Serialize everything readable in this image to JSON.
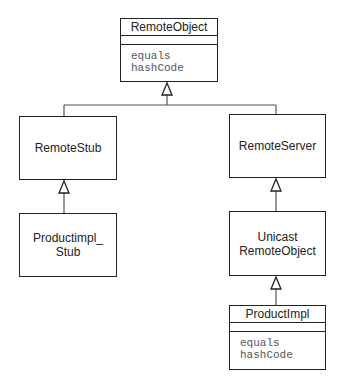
{
  "diagram": {
    "type": "uml-class-inheritance",
    "classes": {
      "remote_object": {
        "name": "RemoteObject",
        "methods": [
          "equals",
          "hashCode"
        ]
      },
      "remote_stub": {
        "name": "RemoteStub"
      },
      "remote_server": {
        "name": "RemoteServer"
      },
      "product_impl_stub": {
        "name_lines": [
          "Productimpl_",
          "Stub"
        ]
      },
      "unicast_remote_object": {
        "name_lines": [
          "Unicast",
          "RemoteObject"
        ]
      },
      "product_impl": {
        "name": "ProductImpl",
        "methods": [
          "equals",
          "hashCode"
        ]
      }
    },
    "relationships": [
      {
        "from": "RemoteStub",
        "to": "RemoteObject",
        "kind": "generalization"
      },
      {
        "from": "RemoteServer",
        "to": "RemoteObject",
        "kind": "generalization"
      },
      {
        "from": "Productimpl_Stub",
        "to": "RemoteStub",
        "kind": "generalization"
      },
      {
        "from": "UnicastRemoteObject",
        "to": "RemoteServer",
        "kind": "generalization"
      },
      {
        "from": "ProductImpl",
        "to": "UnicastRemoteObject",
        "kind": "generalization"
      }
    ],
    "colors": {
      "line": "#222222",
      "connector": "#555555",
      "method_text": "#555555",
      "background": "#ffffff"
    }
  }
}
